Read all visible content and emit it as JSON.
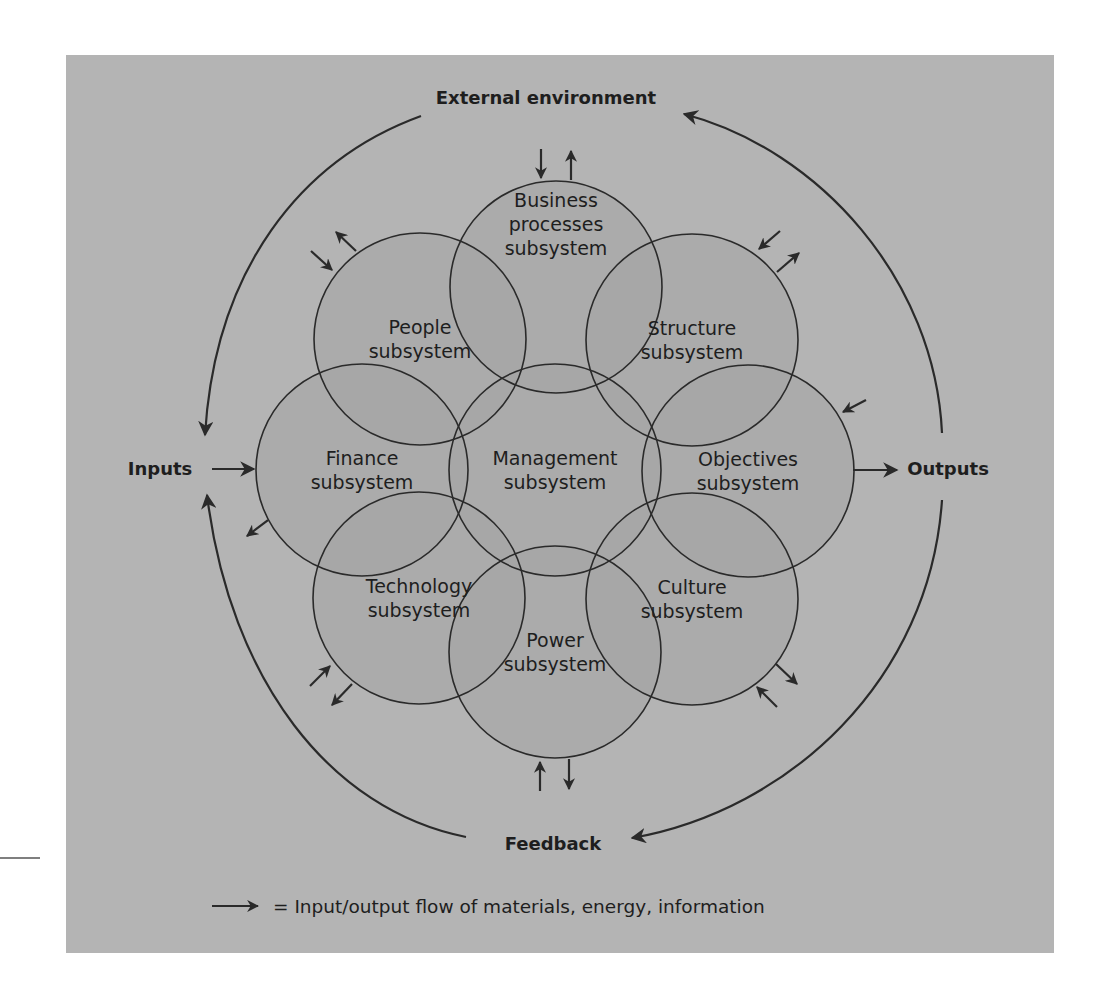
{
  "diagram": {
    "colors": {
      "panel": "#b4b4b4",
      "circle_fill": "#a4a4a4",
      "stroke": "#2a2a2a",
      "text": "#1e1e1e",
      "page": "#ffffff"
    },
    "labels": {
      "external_environment": "External environment",
      "inputs": "Inputs",
      "outputs": "Outputs",
      "feedback": "Feedback"
    },
    "subsystems": [
      {
        "id": "business-processes",
        "lines": [
          "Business",
          "processes",
          "subsystem"
        ],
        "position": "top",
        "flows": [
          "in",
          "out"
        ]
      },
      {
        "id": "people",
        "lines": [
          "People",
          "subsystem"
        ],
        "position": "upper-left",
        "flows": [
          "in",
          "out"
        ]
      },
      {
        "id": "structure",
        "lines": [
          "Structure",
          "subsystem"
        ],
        "position": "upper-right",
        "flows": [
          "in",
          "out"
        ]
      },
      {
        "id": "finance",
        "lines": [
          "Finance",
          "subsystem"
        ],
        "position": "middle-left",
        "flows": [
          "in",
          "out"
        ]
      },
      {
        "id": "management",
        "lines": [
          "Management",
          "subsystem"
        ],
        "position": "center",
        "flows": []
      },
      {
        "id": "objectives",
        "lines": [
          "Objectives",
          "subsystem"
        ],
        "position": "middle-right",
        "flows": [
          "in",
          "out"
        ]
      },
      {
        "id": "technology",
        "lines": [
          "Technology",
          "subsystem"
        ],
        "position": "lower-left",
        "flows": [
          "in",
          "out"
        ]
      },
      {
        "id": "culture",
        "lines": [
          "Culture",
          "subsystem"
        ],
        "position": "lower-right",
        "flows": [
          "in",
          "out"
        ]
      },
      {
        "id": "power",
        "lines": [
          "Power",
          "subsystem"
        ],
        "position": "bottom",
        "flows": [
          "in",
          "out"
        ]
      }
    ],
    "cycle": [
      "External environment",
      "Inputs",
      "Outputs",
      "Feedback"
    ],
    "legend": {
      "symbol": "arrow",
      "text": "= Input/output flow of materials, energy, information"
    }
  }
}
